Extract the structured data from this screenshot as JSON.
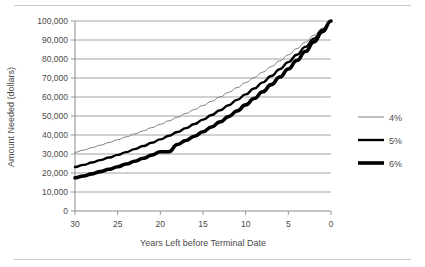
{
  "chart_data": {
    "type": "line",
    "title": "",
    "xlabel": "Years Left before Terminal Date",
    "ylabel": "Amount Needed (dollars)",
    "x": [
      30,
      29,
      28,
      27,
      26,
      25,
      24,
      23,
      22,
      21,
      20,
      19,
      18,
      17,
      16,
      15,
      14,
      13,
      12,
      11,
      10,
      9,
      8,
      7,
      6,
      5,
      4,
      3,
      2,
      1,
      0
    ],
    "xlim": [
      30,
      0
    ],
    "ylim": [
      0,
      100000
    ],
    "x_tick_labels": [
      "30",
      "25",
      "20",
      "15",
      "10",
      "5",
      "0"
    ],
    "x_ticks": [
      30,
      25,
      20,
      15,
      10,
      5,
      0
    ],
    "y_ticks": [
      0,
      10000,
      20000,
      30000,
      40000,
      50000,
      60000,
      70000,
      80000,
      90000,
      100000
    ],
    "y_tick_labels": [
      "0",
      "10,000",
      "20,000",
      "30,000",
      "40,000",
      "50,000",
      "60,000",
      "70,000",
      "80,000",
      "90,000",
      "100,000"
    ],
    "grid": true,
    "x_axis_reversed": true,
    "legend_position": "right",
    "series": [
      {
        "name": "4%",
        "rate": 0.04,
        "color": "#7f7f7f",
        "line_width": 1,
        "values": [
          30832,
          32065,
          33348,
          34682,
          36069,
          37512,
          39012,
          40573,
          42196,
          43883,
          45639,
          47464,
          49363,
          51337,
          53391,
          55526,
          57748,
          60057,
          62460,
          64958,
          67556,
          70259,
          73069,
          75992,
          79031,
          82193,
          85480,
          88900,
          92456,
          96154,
          100000
        ]
      },
      {
        "name": "5%",
        "rate": 0.05,
        "color": "#000000",
        "line_width": 2.4,
        "values": [
          23138,
          24295,
          25509,
          26785,
          28124,
          29530,
          31007,
          32557,
          34185,
          35894,
          37689,
          39573,
          41552,
          43630,
          45811,
          48102,
          50507,
          53032,
          55684,
          58468,
          61391,
          64461,
          67684,
          71068,
          74622,
          78353,
          82270,
          86384,
          90703,
          95238,
          100000
        ]
      },
      {
        "name": "6%",
        "rate": 0.06,
        "color": "#000000",
        "line_width": 3.6,
        "values": [
          17411,
          18456,
          19563,
          20737,
          21981,
          23300,
          24698,
          26180,
          27751,
          29416,
          31180,
          31180,
          35034,
          37136,
          39365,
          41727,
          44230,
          46884,
          49697,
          52679,
          55839,
          59190,
          62741,
          66506,
          70496,
          74726,
          79209,
          83962,
          89000,
          94340,
          100000
        ]
      }
    ]
  },
  "legend": {
    "items": [
      {
        "label": "4%"
      },
      {
        "label": "5%"
      },
      {
        "label": "6%"
      }
    ]
  }
}
